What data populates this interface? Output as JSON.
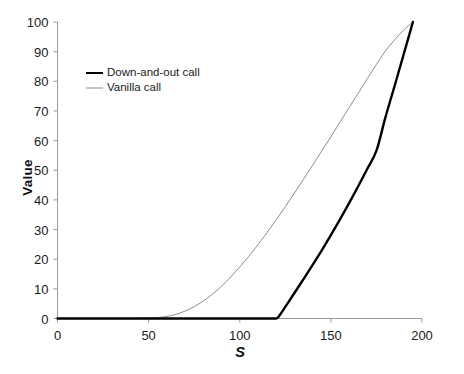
{
  "chart_data": {
    "type": "line",
    "title": "",
    "xlabel": "S",
    "ylabel": "Value",
    "xlim": [
      0,
      200
    ],
    "ylim": [
      0,
      100
    ],
    "grid": false,
    "legend_position": "upper-left-inside",
    "xticks": [
      0,
      50,
      100,
      150,
      200
    ],
    "xtick_labels": [
      "0",
      "50",
      "100",
      "150",
      "200"
    ],
    "yticks": [
      0,
      10,
      20,
      30,
      40,
      50,
      60,
      70,
      80,
      90,
      100
    ],
    "ytick_labels": [
      "0",
      "10",
      "20",
      "30",
      "40",
      "50",
      "60",
      "70",
      "80",
      "90",
      "100"
    ],
    "series": [
      {
        "name": "Down-and-out call",
        "color": "#000000",
        "width": 2.4,
        "x": [
          0,
          10,
          20,
          30,
          40,
          50,
          60,
          70,
          80,
          90,
          100,
          110,
          118,
          120,
          121,
          122,
          124,
          127,
          130,
          135,
          140,
          145,
          150,
          155,
          160,
          165,
          170,
          175,
          180,
          185,
          190,
          195
        ],
        "y": [
          0,
          0,
          0,
          0,
          0,
          0,
          0,
          0,
          0,
          0,
          0,
          0,
          0,
          0,
          0.4,
          1.2,
          3.0,
          5.8,
          8.6,
          13.3,
          18.1,
          23.0,
          28.1,
          33.4,
          38.9,
          44.6,
          50.5,
          56.6,
          68.0,
          78.5,
          89.2,
          100
        ]
      },
      {
        "name": "Vanilla call",
        "color": "#8c8c8c",
        "width": 1.0,
        "x": [
          0,
          10,
          20,
          30,
          40,
          50,
          55,
          60,
          65,
          70,
          75,
          80,
          85,
          90,
          95,
          100,
          105,
          110,
          115,
          120,
          125,
          130,
          135,
          140,
          145,
          150,
          155,
          160,
          165,
          170,
          175,
          180,
          185,
          190,
          195
        ],
        "y": [
          0,
          0,
          0,
          0,
          0,
          0.1,
          0.3,
          0.7,
          1.4,
          2.5,
          4.0,
          5.9,
          8.2,
          10.9,
          14.0,
          17.4,
          21.0,
          24.9,
          29.0,
          33.3,
          37.7,
          42.3,
          47.0,
          51.7,
          56.5,
          61.3,
          66.2,
          71.1,
          76.0,
          80.9,
          85.7,
          90.3,
          94.0,
          97.3,
          100
        ]
      }
    ],
    "annotations": []
  },
  "legend": {
    "items": [
      {
        "label": "Down-and-out call"
      },
      {
        "label": "Vanilla call"
      }
    ]
  },
  "colors": {
    "axis": "#9a9a9a",
    "text": "#1a1a1a",
    "series_primary": "#000000",
    "series_secondary": "#8c8c8c",
    "background": "#ffffff"
  }
}
